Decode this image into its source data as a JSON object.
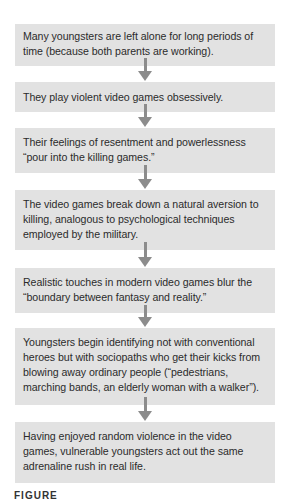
{
  "flowchart": {
    "steps": [
      {
        "text": "Many youngsters are left alone for long periods of time (because both parents are working)."
      },
      {
        "text": "They play violent video games obsessively."
      },
      {
        "text": "Their feelings of resentment and powerlessness “pour into the killing games.”"
      },
      {
        "text": "The video games break down a natural aversion to killing, analogous to psychological techniques employed by the military."
      },
      {
        "text": "Realistic touches in modern video games blur the “boundary between fantasy and reality.”"
      },
      {
        "text": "Youngsters begin identifying not with conventional heroes but with sociopaths who get their kicks from blowing away ordinary people (“pedestrians, marching bands, an elderly woman with a walker”)."
      },
      {
        "text": "Having enjoyed random violence in the video games, vulnerable youngsters act out the same adrenaline rush in real life."
      }
    ],
    "arrow_icon": "down-arrow-icon",
    "colors": {
      "box_fill": "#e2e2e2",
      "arrow": "#8c8c8c",
      "text": "#2b2b2b"
    }
  },
  "caption": {
    "label": "FIGURE"
  }
}
